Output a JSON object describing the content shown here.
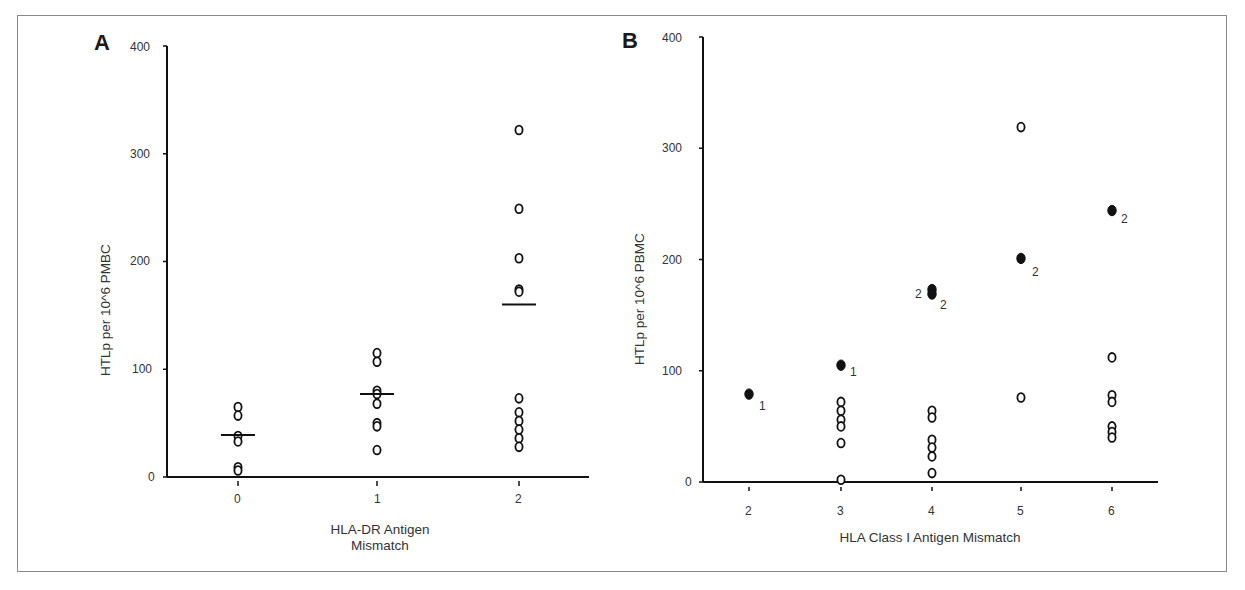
{
  "panels": {
    "a": {
      "letter": "A",
      "y_ticks": [
        "0",
        "100",
        "200",
        "300",
        "400"
      ],
      "x_ticks": [
        "0",
        "1",
        "2"
      ],
      "ylabel": "HTLp per 10^6 PMBC",
      "xlabel_line1": "HLA-DR Antigen",
      "xlabel_line2": "Mismatch"
    },
    "b": {
      "letter": "B",
      "y_ticks": [
        "0",
        "100",
        "200",
        "300",
        "400"
      ],
      "x_ticks": [
        "2",
        "3",
        "4",
        "5",
        "6"
      ],
      "ylabel": "HTLp per 10^6 PBMC",
      "xlabel": "HLA Class I Antigen  Mismatch",
      "annotations": [
        "1",
        "1",
        "2",
        "2",
        "2",
        "2"
      ]
    }
  },
  "chart_data": [
    {
      "type": "scatter",
      "title": "A",
      "xlabel": "HLA-DR Antigen Mismatch",
      "ylabel": "HTLp per 10^6 PMBC",
      "ylim": [
        0,
        400
      ],
      "categories": [
        "0",
        "1",
        "2"
      ],
      "series": [
        {
          "name": "individual (open circles)",
          "x": "0",
          "values": [
            65,
            57,
            38,
            33,
            9,
            6
          ]
        },
        {
          "name": "individual (open circles)",
          "x": "1",
          "values": [
            115,
            107,
            80,
            77,
            68,
            50,
            47,
            25
          ]
        },
        {
          "name": "individual (open circles)",
          "x": "2",
          "values": [
            322,
            249,
            203,
            174,
            172,
            73,
            60,
            52,
            44,
            36,
            28
          ]
        }
      ],
      "means": {
        "0": 39,
        "1": 77,
        "2": 160
      },
      "grid": false
    },
    {
      "type": "scatter",
      "title": "B",
      "xlabel": "HLA Class I Antigen Mismatch",
      "ylabel": "HTLp per 10^6 PBMC",
      "ylim": [
        0,
        400
      ],
      "categories": [
        "2",
        "3",
        "4",
        "5",
        "6"
      ],
      "series": [
        {
          "name": "open circles",
          "points": [
            {
              "x": "3",
              "y": [
                72,
                64,
                56,
                50,
                35,
                2
              ]
            },
            {
              "x": "4",
              "y": [
                64,
                58,
                38,
                31,
                23,
                8
              ]
            },
            {
              "x": "5",
              "y": [
                319,
                76
              ]
            },
            {
              "x": "6",
              "y": [
                112,
                78,
                72,
                50,
                45,
                40
              ]
            }
          ]
        },
        {
          "name": "filled circles (annotated)",
          "points": [
            {
              "x": "2",
              "y": 79,
              "label": "1"
            },
            {
              "x": "3",
              "y": 105,
              "label": "1"
            },
            {
              "x": "4",
              "y": 173,
              "label": "2"
            },
            {
              "x": "4",
              "y": 169,
              "label": "2"
            },
            {
              "x": "5",
              "y": 201,
              "label": "2"
            },
            {
              "x": "6",
              "y": 244,
              "label": "2"
            }
          ]
        }
      ],
      "grid": false
    }
  ]
}
